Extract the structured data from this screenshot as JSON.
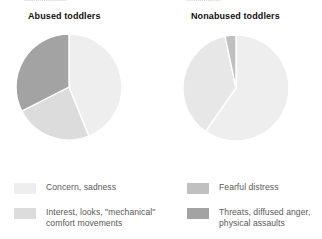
{
  "figure": {
    "scan_artifact_left": "......................",
    "scan_artifact_right": "..................",
    "titles": {
      "left": "Abused toddlers",
      "right": "Nonabused toddlers"
    }
  },
  "legend": {
    "items": [
      {
        "key": "concern",
        "label": "Concern, sadness",
        "color": "#eeeeee"
      },
      {
        "key": "interest",
        "label": "Interest, looks, \"mechanical\"\ncomfort movements",
        "color": "#dcdcdc"
      },
      {
        "key": "fearful",
        "label": "Fearful distress",
        "color": "#c0c0c0"
      },
      {
        "key": "threats",
        "label": "Threats, diffused anger,\nphysical assaults",
        "color": "#a3a3a3"
      }
    ]
  },
  "chart_data": [
    {
      "type": "pie",
      "title": "Abused toddlers",
      "labels": [
        "Concern, sadness",
        "Interest, looks, \"mechanical\" comfort movements",
        "Threats, diffused anger, physical assaults"
      ],
      "values": [
        44,
        24,
        32
      ],
      "unit": "percent",
      "colors": [
        "#eeeeee",
        "#dcdcdc",
        "#a3a3a3"
      ],
      "start_angle_deg": 0,
      "direction": "clockwise",
      "boundaries_deg": [
        0,
        158,
        243,
        360
      ],
      "legend_position": "below",
      "grid": false
    },
    {
      "type": "pie",
      "title": "Nonabused toddlers",
      "labels": [
        "Concern, sadness",
        "Interest, looks, \"mechanical\" comfort movements",
        "Fearful distress"
      ],
      "values": [
        60,
        37,
        3
      ],
      "unit": "percent",
      "colors": [
        "#eeeeee",
        "#e7e7e7",
        "#c0c0c0"
      ],
      "start_angle_deg": 0,
      "direction": "clockwise",
      "boundaries_deg": [
        0,
        215,
        348,
        360
      ],
      "legend_position": "below",
      "grid": false
    }
  ]
}
